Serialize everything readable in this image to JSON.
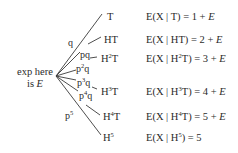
{
  "root": {
    "line1": "exp here",
    "line2_prefix": "is ",
    "line2_var": "E"
  },
  "branches": [
    {
      "prob": "q",
      "prob_sup": "",
      "prob_tail": "",
      "outcome": "T",
      "outcome_sup": "",
      "outcome_tail": "",
      "expectation": {
        "pre": "E(X | ",
        "base": "T",
        "sup": "",
        "tail": "",
        "post": ") = 1 + ",
        "var": "E"
      }
    },
    {
      "prob": "pq",
      "prob_sup": "",
      "prob_tail": "",
      "outcome": "HT",
      "outcome_sup": "",
      "outcome_tail": "",
      "expectation": {
        "pre": "E(X | ",
        "base": "HT",
        "sup": "",
        "tail": "",
        "post": ") = 2 + ",
        "var": "E"
      }
    },
    {
      "prob": "p",
      "prob_sup": "2",
      "prob_tail": "q",
      "outcome": "H",
      "outcome_sup": "2",
      "outcome_tail": "T",
      "expectation": {
        "pre": "E(X | ",
        "base": "H",
        "sup": "2",
        "tail": "T",
        "post": ") = 3 + ",
        "var": "E"
      }
    },
    {
      "prob": "p",
      "prob_sup": "3",
      "prob_tail": "q",
      "outcome": "H",
      "outcome_sup": "3",
      "outcome_tail": "T",
      "expectation": {
        "pre": "E(X | ",
        "base": "H",
        "sup": "3",
        "tail": "T",
        "post": ") = 4 + ",
        "var": "E"
      }
    },
    {
      "prob": "p",
      "prob_sup": "4",
      "prob_tail": "q",
      "outcome": "H",
      "outcome_sup": "4",
      "outcome_tail": "T",
      "expectation": {
        "pre": "E(X | ",
        "base": "H",
        "sup": "4",
        "tail": "T",
        "post": ") = 5 + ",
        "var": "E"
      }
    },
    {
      "prob": "p",
      "prob_sup": "5",
      "prob_tail": "",
      "outcome": "H",
      "outcome_sup": "5",
      "outcome_tail": "",
      "expectation": {
        "pre": "E(X | ",
        "base": "H",
        "sup": "5",
        "tail": "",
        "post": ") = 5",
        "var": ""
      }
    }
  ]
}
